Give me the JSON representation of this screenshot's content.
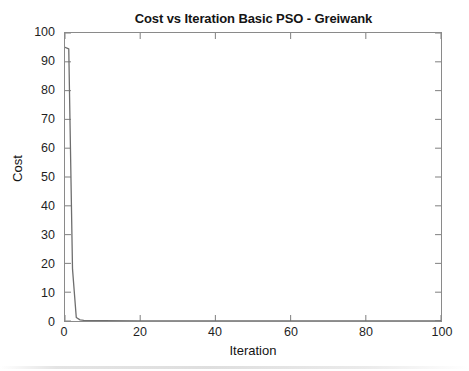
{
  "chart_data": {
    "type": "line",
    "title": "Cost vs Iteration Basic PSO - Greiwank",
    "xlabel": "Iteration",
    "ylabel": "Cost",
    "xlim": [
      0,
      100
    ],
    "ylim": [
      0,
      100
    ],
    "xticks": [
      0,
      20,
      40,
      60,
      80,
      100
    ],
    "yticks": [
      0,
      10,
      20,
      30,
      40,
      50,
      60,
      70,
      80,
      90,
      100
    ],
    "xtick_labels": [
      "0",
      "20",
      "40",
      "60",
      "80",
      "100"
    ],
    "ytick_labels": [
      "0",
      "10",
      "20",
      "30",
      "40",
      "50",
      "60",
      "70",
      "80",
      "90",
      "100"
    ],
    "grid": false,
    "legend": null,
    "box": true,
    "tick_direction": "in",
    "line_color": "#6e6e6e",
    "axis_color": "#8a8a8a",
    "background": "#ffffff",
    "series": [
      {
        "name": "Cost",
        "x": [
          0,
          1,
          2,
          3,
          4,
          5,
          10,
          20,
          30,
          40,
          50,
          60,
          70,
          80,
          90,
          100
        ],
        "values": [
          95.0,
          94.5,
          18.0,
          1.2,
          0.4,
          0.25,
          0.12,
          0.06,
          0.04,
          0.03,
          0.02,
          0.02,
          0.01,
          0.01,
          0.01,
          0.01
        ]
      }
    ],
    "annotations": []
  },
  "figure": {
    "title": "Cost vs Iteration Basic PSO - Greiwank",
    "xlabel": "Iteration",
    "ylabel": "Cost"
  }
}
